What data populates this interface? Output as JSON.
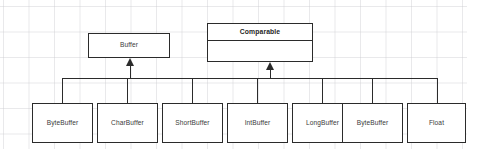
{
  "diagram": {
    "type": "uml-class-hierarchy",
    "parents": [
      {
        "id": "buffer",
        "label": "Buffer",
        "style": "class",
        "x": 88,
        "y": 33,
        "w": 82,
        "h": 25
      },
      {
        "id": "comparable",
        "label": "Comparable",
        "style": "interface",
        "x": 207,
        "y": 23,
        "w": 106,
        "h": 39
      }
    ],
    "children": [
      {
        "id": "bytebuffer-1",
        "label": "ByteBuffer",
        "x": 32,
        "y": 103,
        "w": 61,
        "h": 40
      },
      {
        "id": "charbuffer",
        "label": "CharBuffer",
        "x": 97,
        "y": 103,
        "w": 61,
        "h": 40
      },
      {
        "id": "shortbuffer",
        "label": "ShortBuffer",
        "x": 162,
        "y": 103,
        "w": 61,
        "h": 40
      },
      {
        "id": "intbuffer",
        "label": "IntBuffer",
        "x": 227,
        "y": 103,
        "w": 61,
        "h": 40
      },
      {
        "id": "longbuffer",
        "label": "LongBuffer",
        "x": 292,
        "y": 103,
        "w": 61,
        "h": 40
      },
      {
        "id": "bytebuffer-2",
        "label": "ByteBuffer",
        "x": 342,
        "y": 103,
        "w": 61,
        "h": 40
      },
      {
        "id": "float",
        "label": "Float",
        "x": 407,
        "y": 103,
        "w": 59,
        "h": 40
      }
    ],
    "connector": {
      "bus_y": 78,
      "bus_left": 62,
      "bus_right": 437,
      "arrow_targets": [
        {
          "x": 130,
          "top": 58
        },
        {
          "x": 270,
          "top": 62
        }
      ],
      "drop_xs": [
        62,
        127,
        192,
        257,
        322,
        372,
        437
      ]
    },
    "colors": {
      "stroke": "#2b2b2b",
      "text": "#3a3a3a",
      "heading_text": "#1f1f1f",
      "background": "#ffffff",
      "grid": "#c8c8cd"
    }
  }
}
